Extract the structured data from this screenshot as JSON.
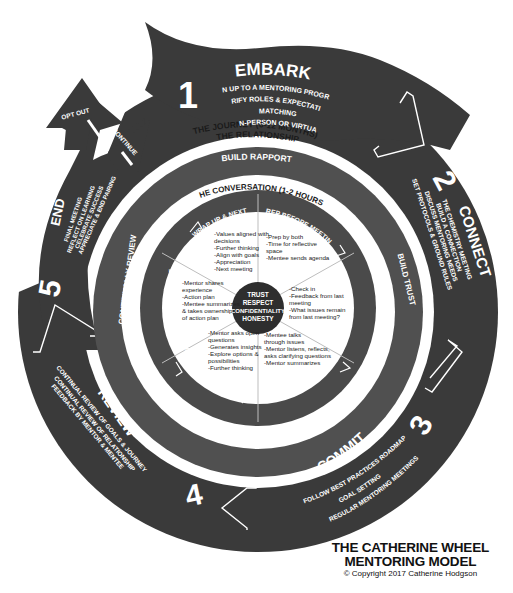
{
  "colors": {
    "dark": "#3a3a3a",
    "mid": "#505050",
    "white": "#ffffff",
    "center": "#2e2e2e"
  },
  "journey": {
    "label": "THE JOURNEY (6-12 MONTHS)",
    "stages": [
      {
        "number": "1",
        "title": "EMBARK",
        "items": [
          "SIGN UP TO A MENTORING PROGRAM",
          "CLARIFY ROLES & EXPECTATIONS",
          "MATCHING",
          "IN-PERSON OR VIRTUAL"
        ]
      },
      {
        "number": "2",
        "title": "CONNECT",
        "items": [
          "THE CHEMISTRY MEETING",
          "BUILD A CONNECTION",
          "DISCUSS MENTORING NEEDS",
          "SET PROTOCOLS & GROUND RULES"
        ]
      },
      {
        "number": "3",
        "title": "COMMIT",
        "items": [
          "FOLLOW BEST PRACTICES ROADMAP",
          "GOAL SETTING",
          "REGULAR MENTORING MEETINGS"
        ]
      },
      {
        "number": "4",
        "title": "REVIEW",
        "items": [
          "CONTINUAL REVIEW OF GOALS & JOURNEY",
          "CONTINUAL REVIEW OF RELATIONSHIP",
          "FEEDBACK BY MENTOR & MENTEE"
        ]
      },
      {
        "number": "5",
        "title": "END",
        "items": [
          "FINAL MEETING",
          "REFLECT ON LEARNING",
          "CELEBRATE SUCCESS",
          "APPRECIATE & END PAIRING"
        ]
      }
    ],
    "exits": {
      "opt_out": "OPT OUT",
      "continue": "CONTINUE"
    }
  },
  "relationship": {
    "label": "THE RELATIONSHIP",
    "phases": [
      "BUILD RAPPORT",
      "BUILD TRUST",
      "CONTINUALLY REVIEW"
    ]
  },
  "conversation": {
    "label": "THE CONVERSATION (1-2 HOURS)",
    "segments": [
      {
        "title": "PREP BEFORE MEETING",
        "items": [
          "-Prep by both",
          "-Time for reflective",
          "space",
          "-Mentee sends agenda"
        ]
      },
      {
        "title": "UPDATE",
        "items": [
          "-Check in",
          "-Feedback from last",
          "meeting",
          "-What issues remain",
          "from last meeting?"
        ]
      },
      {
        "title": "INSIGHTS & ISSUES",
        "items": [
          "-Mentee talks",
          "through issues",
          "-Mentor listens, reflects,",
          "asks clarifying questions",
          "-Mentor summarizes"
        ]
      },
      {
        "title": "EXPLORE POSSIBILITIES",
        "items": [
          "-Mentor asks open",
          "questions",
          "-Generates insights",
          "-Explore options &",
          "possibilities",
          "-Further thinking"
        ]
      },
      {
        "title": "BUILD CONFIDENCE AND ACTION",
        "title_lines": [
          "BUILD CONFIDENCE",
          "AND ACTION"
        ],
        "items": [
          "-Mentor shares",
          "experience",
          "-Action plan",
          "-Mentee summarizes",
          "& takes ownership",
          "of action plan"
        ]
      },
      {
        "title": "WRAP UP & NEXT",
        "items": [
          "-Values aligned with",
          "decisions",
          "-Further thinking",
          "-Align with goals",
          "-Appreciation",
          "-Next meeting"
        ]
      }
    ],
    "core": [
      "TRUST",
      "RESPECT",
      "CONFIDENTIALITY",
      "HONESTY"
    ]
  },
  "footer": {
    "title_line1": "THE CATHERINE WHEEL",
    "title_line2": "MENTORING MODEL",
    "copyright": "© Copyright 2017 Catherine Hodgson"
  }
}
